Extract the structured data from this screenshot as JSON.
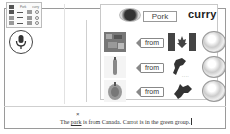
{
  "legend": {
    "rows": [
      {
        "label": "Pork",
        "label2": "curry"
      },
      {
        "label": "",
        "label2": ""
      },
      {
        "label": "",
        "label2": ""
      },
      {
        "label": "",
        "label2": ""
      }
    ]
  },
  "mic": {
    "icon": "microphone-icon"
  },
  "card": {
    "header": {
      "food_word": "Pork",
      "dish_word": "curry"
    },
    "rows": [
      {
        "food": "meat",
        "connector": "from",
        "origin": "Canada flag",
        "group": "globe"
      },
      {
        "food": "carrot",
        "connector": "from",
        "origin": "New Zealand map",
        "group": "globe"
      },
      {
        "food": "onion",
        "connector": "from",
        "origin": "Hokkaido map",
        "group": "globe"
      }
    ]
  },
  "sentence": {
    "error_mark": "×",
    "prefix": "The ",
    "error_word": "park",
    "rest": " is from Canada.  Carrot  is in the green group."
  },
  "colors": {
    "frame": "#9a9a9a",
    "text": "#222222",
    "background": "#ffffff"
  }
}
